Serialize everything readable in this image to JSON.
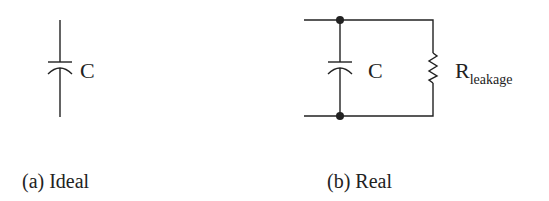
{
  "diagram": {
    "ideal": {
      "caption": "(a) Ideal",
      "capacitor_label": "C"
    },
    "real": {
      "caption": "(b) Real",
      "capacitor_label": "C",
      "resistor_label_main": "R",
      "resistor_label_sub": "leakage"
    },
    "colors": {
      "stroke": "#222222",
      "background": "#ffffff"
    },
    "icons": [
      "capacitor-symbol",
      "resistor-symbol",
      "junction-node"
    ]
  }
}
